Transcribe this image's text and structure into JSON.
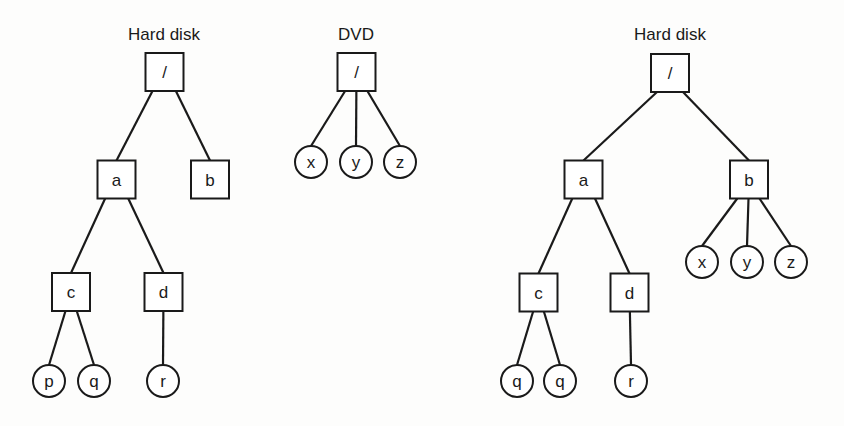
{
  "diagram": {
    "colors": {
      "stroke": "#1a1a1a",
      "background": "#fdfdfc"
    },
    "trees": [
      {
        "id": "left",
        "title": "Hard disk",
        "title_pos": [
          164,
          40
        ],
        "nodes": [
          {
            "id": "root",
            "label": "/",
            "shape": "box",
            "x": 164.5,
            "y": 72
          },
          {
            "id": "a",
            "label": "a",
            "shape": "box",
            "x": 116.5,
            "y": 179.5
          },
          {
            "id": "b",
            "label": "b",
            "shape": "box",
            "x": 210,
            "y": 179.5
          },
          {
            "id": "c",
            "label": "c",
            "shape": "box",
            "x": 71,
            "y": 292
          },
          {
            "id": "d",
            "label": "d",
            "shape": "box",
            "x": 163.5,
            "y": 292
          },
          {
            "id": "p",
            "label": "p",
            "shape": "circle",
            "x": 49,
            "y": 381
          },
          {
            "id": "q",
            "label": "q",
            "shape": "circle",
            "x": 94,
            "y": 381
          },
          {
            "id": "r",
            "label": "r",
            "shape": "circle",
            "x": 163,
            "y": 381
          }
        ],
        "edges": [
          [
            "root",
            "a"
          ],
          [
            "root",
            "b"
          ],
          [
            "a",
            "c"
          ],
          [
            "a",
            "d"
          ],
          [
            "c",
            "p"
          ],
          [
            "c",
            "q"
          ],
          [
            "d",
            "r"
          ]
        ]
      },
      {
        "id": "dvd",
        "title": "DVD",
        "title_pos": [
          356,
          40
        ],
        "nodes": [
          {
            "id": "root",
            "label": "/",
            "shape": "box",
            "x": 356.5,
            "y": 72
          },
          {
            "id": "x",
            "label": "x",
            "shape": "circle",
            "x": 311,
            "y": 162
          },
          {
            "id": "y",
            "label": "y",
            "shape": "circle",
            "x": 356,
            "y": 162
          },
          {
            "id": "z",
            "label": "z",
            "shape": "circle",
            "x": 400,
            "y": 162
          }
        ],
        "edges": [
          [
            "root",
            "x"
          ],
          [
            "root",
            "y"
          ],
          [
            "root",
            "z"
          ]
        ]
      },
      {
        "id": "right",
        "title": "Hard disk",
        "title_pos": [
          670,
          40
        ],
        "nodes": [
          {
            "id": "root",
            "label": "/",
            "shape": "box",
            "x": 670,
            "y": 73
          },
          {
            "id": "a",
            "label": "a",
            "shape": "box",
            "x": 583.5,
            "y": 179.5
          },
          {
            "id": "b",
            "label": "b",
            "shape": "box",
            "x": 749,
            "y": 179.5
          },
          {
            "id": "x",
            "label": "x",
            "shape": "circle",
            "x": 702,
            "y": 262
          },
          {
            "id": "y",
            "label": "y",
            "shape": "circle",
            "x": 747,
            "y": 262
          },
          {
            "id": "z",
            "label": "z",
            "shape": "circle",
            "x": 791,
            "y": 262
          },
          {
            "id": "c",
            "label": "c",
            "shape": "box",
            "x": 538.5,
            "y": 292.5
          },
          {
            "id": "d",
            "label": "d",
            "shape": "box",
            "x": 629.5,
            "y": 292.5
          },
          {
            "id": "q1",
            "label": "q",
            "shape": "circle",
            "x": 517,
            "y": 381
          },
          {
            "id": "q2",
            "label": "q",
            "shape": "circle",
            "x": 560,
            "y": 381
          },
          {
            "id": "r",
            "label": "r",
            "shape": "circle",
            "x": 631,
            "y": 381
          }
        ],
        "edges": [
          [
            "root",
            "a"
          ],
          [
            "root",
            "b"
          ],
          [
            "b",
            "x"
          ],
          [
            "b",
            "y"
          ],
          [
            "b",
            "z"
          ],
          [
            "a",
            "c"
          ],
          [
            "a",
            "d"
          ],
          [
            "c",
            "q1"
          ],
          [
            "c",
            "q2"
          ],
          [
            "d",
            "r"
          ]
        ]
      }
    ]
  }
}
